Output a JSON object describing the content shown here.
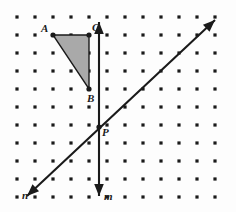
{
  "figure": {
    "background_color": "#fdfdfd",
    "grid": {
      "dot_color": "#1a1a1a",
      "dot_radius": 1.6,
      "columns": 12,
      "rows": 11,
      "origin_x": 17,
      "origin_y": 17,
      "spacing": 18
    },
    "triangle": {
      "name": "triangle-ABC",
      "fill_color": "#a9a9a9",
      "stroke_color": "#1a1a1a",
      "vertices": [
        {
          "label": "A",
          "x": 53,
          "y": 35
        },
        {
          "label": "C",
          "x": 89,
          "y": 35
        },
        {
          "label": "B",
          "x": 89,
          "y": 89
        }
      ]
    },
    "lines": [
      {
        "label": "m",
        "name": "line-m-vertical",
        "color": "#1a1a1a",
        "x1": 99,
        "y1": 22,
        "x2": 99,
        "y2": 196,
        "arrows": "both"
      },
      {
        "label": "n",
        "name": "line-n-diagonal",
        "color": "#1a1a1a",
        "x1": 27,
        "y1": 196,
        "x2": 215,
        "y2": 20,
        "arrows": "both"
      }
    ],
    "points": [
      {
        "label": "A",
        "name": "point-A",
        "x": 53,
        "y": 35,
        "label_dx": -12,
        "label_dy": -12
      },
      {
        "label": "C",
        "name": "point-C",
        "x": 89,
        "y": 35,
        "label_dx": 3,
        "label_dy": -13
      },
      {
        "label": "B",
        "name": "point-B",
        "x": 89,
        "y": 89,
        "label_dx": -2,
        "label_dy": 4
      },
      {
        "label": "P",
        "name": "point-P",
        "x": 99,
        "y": 127,
        "label_dx": 3,
        "label_dy": 0
      }
    ],
    "line_labels": [
      {
        "label": "n",
        "name": "line-label-n",
        "x": 22,
        "y": 190
      },
      {
        "label": "m",
        "name": "line-label-m",
        "x": 104,
        "y": 191
      }
    ]
  }
}
